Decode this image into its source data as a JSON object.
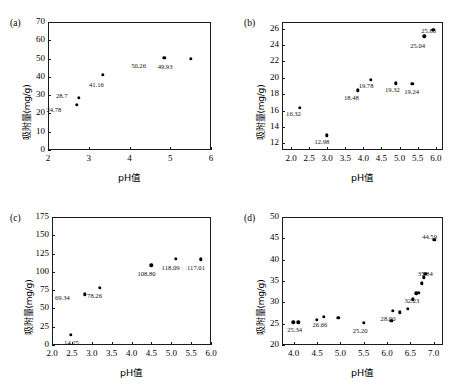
{
  "figure": {
    "axis_title_x": "pH值",
    "axis_title_y": "吸附量(mg/g)"
  },
  "panels": [
    {
      "tag": "(a)"
    },
    {
      "tag": "(b)"
    },
    {
      "tag": "(c)"
    },
    {
      "tag": "(d)"
    }
  ],
  "chart_data": [
    {
      "type": "scatter",
      "panel": "(a)",
      "title": "",
      "xlabel": "pH值",
      "ylabel": "吸附量(mg/g)",
      "xlim": [
        2,
        6
      ],
      "ylim": [
        0,
        70
      ],
      "xticks": [
        "2",
        "3",
        "4",
        "5",
        "6"
      ],
      "yticks": [
        "0",
        "10",
        "20",
        "30",
        "40",
        "50",
        "60",
        "70"
      ],
      "grid": false,
      "legend": "none",
      "points": [
        {
          "x": 2.7,
          "y": 24.78,
          "label": "24.78",
          "lx": -30,
          "ly": 6
        },
        {
          "x": 2.76,
          "y": 28.7,
          "label": "28.7",
          "lx": -23,
          "ly": -1
        },
        {
          "x": 3.35,
          "y": 41.16,
          "label": "41.16",
          "lx": -14,
          "ly": 11
        },
        {
          "x": 4.85,
          "y": 50.26,
          "label": "50.26",
          "lx": -33,
          "ly": 9
        },
        {
          "x": 5.5,
          "y": 49.93,
          "label": "49.93",
          "lx": -33,
          "ly": 9
        }
      ]
    },
    {
      "type": "scatter",
      "panel": "(b)",
      "title": "",
      "xlabel": "pH值",
      "ylabel": "吸附量(mg/g)",
      "xlim": [
        1.75,
        6.2
      ],
      "ylim": [
        11.2,
        26.8
      ],
      "xticks": [
        "2.0",
        "2.5",
        "3.0",
        "3.5",
        "4.0",
        "4.5",
        "5.0",
        "5.5",
        "6.0"
      ],
      "yticks": [
        "12",
        "14",
        "16",
        "18",
        "20",
        "22",
        "24",
        "26"
      ],
      "grid": false,
      "legend": "none",
      "points": [
        {
          "x": 2.25,
          "y": 16.32,
          "label": "16.32",
          "lx": -14,
          "ly": 7
        },
        {
          "x": 2.98,
          "y": 12.98,
          "label": "12.98",
          "lx": -12,
          "ly": 8
        },
        {
          "x": 3.85,
          "y": 18.48,
          "label": "18.48",
          "lx": -14,
          "ly": 9
        },
        {
          "x": 4.2,
          "y": 19.78,
          "label": "19.78",
          "lx": -12,
          "ly": 7
        },
        {
          "x": 4.9,
          "y": 19.32,
          "label": "19.32",
          "lx": -11,
          "ly": 8
        },
        {
          "x": 5.35,
          "y": 19.24,
          "label": "19.24",
          "lx": -8,
          "ly": 9
        },
        {
          "x": 5.68,
          "y": 25.04,
          "label": "25.04",
          "lx": -14,
          "ly": 11
        },
        {
          "x": 5.93,
          "y": 25.86,
          "label": "25.86",
          "lx": -12,
          "ly": 2
        }
      ]
    },
    {
      "type": "scatter",
      "panel": "(c)",
      "title": "",
      "xlabel": "pH值",
      "ylabel": "吸附量(mg/g)",
      "xlim": [
        2.0,
        6.0
      ],
      "ylim": [
        0,
        175
      ],
      "xticks": [
        "2.0",
        "2.5",
        "3.0",
        "3.5",
        "4.0",
        "4.5",
        "5.0",
        "5.5",
        "6.0"
      ],
      "yticks": [
        "0",
        "25",
        "50",
        "75",
        "100",
        "125",
        "150",
        "175"
      ],
      "grid": false,
      "legend": "none",
      "points": [
        {
          "x": 2.48,
          "y": 14.25,
          "label": "14.25",
          "lx": -7,
          "ly": 9
        },
        {
          "x": 2.83,
          "y": 69.34,
          "label": "69.34",
          "lx": -30,
          "ly": 5
        },
        {
          "x": 3.21,
          "y": 78.26,
          "label": "78.26",
          "lx": -13,
          "ly": 9
        },
        {
          "x": 4.5,
          "y": 108.8,
          "label": "108.80",
          "lx": -14,
          "ly": 10
        },
        {
          "x": 5.11,
          "y": 118.09,
          "label": "118.09",
          "lx": -14,
          "ly": 10
        },
        {
          "x": 5.75,
          "y": 117.01,
          "label": "117.01",
          "lx": -14,
          "ly": 10
        }
      ]
    },
    {
      "type": "scatter",
      "panel": "(d)",
      "title": "",
      "xlabel": "pH值",
      "ylabel": "吸附量(mg/g)",
      "xlim": [
        3.75,
        7.2
      ],
      "ylim": [
        20,
        50
      ],
      "xticks": [
        "4.0",
        "4.5",
        "5.0",
        "5.5",
        "6.0",
        "6.5",
        "7.0"
      ],
      "yticks": [
        "20",
        "25",
        "30",
        "35",
        "40",
        "45",
        "50"
      ],
      "grid": false,
      "legend": "none",
      "points": [
        {
          "x": 3.99,
          "y": 25.34,
          "label": "25.34",
          "lx": -6,
          "ly": 9
        },
        {
          "x": 4.1,
          "y": 25.3,
          "label": "",
          "lx": 0,
          "ly": 0
        },
        {
          "x": 4.5,
          "y": 25.9,
          "label": "",
          "lx": 0,
          "ly": 0
        },
        {
          "x": 4.64,
          "y": 26.66,
          "label": "26.66",
          "lx": -11,
          "ly": 9
        },
        {
          "x": 4.96,
          "y": 26.4,
          "label": "",
          "lx": 0,
          "ly": 0
        },
        {
          "x": 5.5,
          "y": 25.2,
          "label": "25.20",
          "lx": -11,
          "ly": 9
        },
        {
          "x": 6.09,
          "y": 25.7,
          "label": "",
          "lx": 0,
          "ly": 0
        },
        {
          "x": 6.12,
          "y": 28.0,
          "label": "28.00",
          "lx": -12,
          "ly": 9
        },
        {
          "x": 6.28,
          "y": 27.7,
          "label": "",
          "lx": 0,
          "ly": 0
        },
        {
          "x": 6.45,
          "y": 28.45,
          "label": "",
          "lx": 0,
          "ly": 0
        },
        {
          "x": 6.55,
          "y": 30.7,
          "label": "",
          "lx": 0,
          "ly": 0
        },
        {
          "x": 6.63,
          "y": 32.1,
          "label": "32.23",
          "lx": -12,
          "ly": 9
        },
        {
          "x": 6.68,
          "y": 32.23,
          "label": "",
          "lx": 0,
          "ly": 0
        },
        {
          "x": 6.74,
          "y": 34.5,
          "label": "",
          "lx": 0,
          "ly": 0
        },
        {
          "x": 6.79,
          "y": 35.84,
          "label": "35.84",
          "lx": -6,
          "ly": -2
        },
        {
          "x": 6.82,
          "y": 36.7,
          "label": "",
          "lx": 0,
          "ly": 0
        },
        {
          "x": 7.01,
          "y": 44.59,
          "label": "44.59",
          "lx": -12,
          "ly": -2
        }
      ]
    }
  ]
}
